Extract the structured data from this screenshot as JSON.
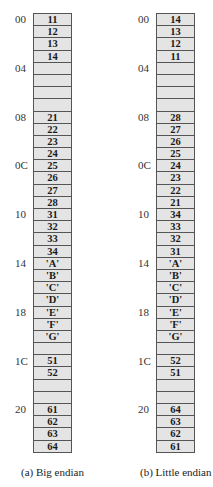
{
  "figure": {
    "address_labels": [
      {
        "row": 0,
        "label": "00"
      },
      {
        "row": 4,
        "label": "04"
      },
      {
        "row": 8,
        "label": "08"
      },
      {
        "row": 12,
        "label": "0C"
      },
      {
        "row": 16,
        "label": "10"
      },
      {
        "row": 20,
        "label": "14"
      },
      {
        "row": 24,
        "label": "18"
      },
      {
        "row": 28,
        "label": "1C"
      },
      {
        "row": 32,
        "label": "20"
      }
    ],
    "big_endian": {
      "caption": "(a) Big endian",
      "cells": [
        "11",
        "12",
        "13",
        "14",
        "",
        "",
        "",
        "",
        "21",
        "22",
        "23",
        "24",
        "25",
        "26",
        "27",
        "28",
        "31",
        "32",
        "33",
        "34",
        "'A'",
        "'B'",
        "'C'",
        "'D'",
        "'E'",
        "'F'",
        "'G'",
        "",
        "51",
        "52",
        "",
        "",
        "61",
        "62",
        "63",
        "64"
      ]
    },
    "little_endian": {
      "caption": "(b) Little endian",
      "cells": [
        "14",
        "13",
        "12",
        "11",
        "",
        "",
        "",
        "",
        "28",
        "27",
        "26",
        "25",
        "24",
        "23",
        "22",
        "21",
        "34",
        "33",
        "32",
        "31",
        "'A'",
        "'B'",
        "'C'",
        "'D'",
        "'E'",
        "'F'",
        "'G'",
        "",
        "52",
        "51",
        "",
        "",
        "64",
        "63",
        "62",
        "61"
      ]
    }
  },
  "colors": {
    "cell_fill": "#e4e4e4",
    "cell_border": "#555555",
    "text": "#222222"
  }
}
